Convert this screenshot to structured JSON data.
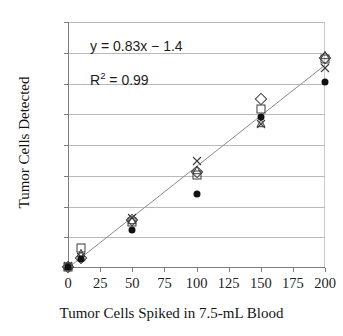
{
  "chart_data": {
    "type": "scatter",
    "title": "",
    "xlabel": "Tumor Cells Spiked in 7.5-mL Blood",
    "ylabel": "Tumor Cells Detected",
    "xlim": [
      0,
      200
    ],
    "ylim": [
      0,
      200
    ],
    "xticks": [
      0,
      25,
      50,
      75,
      100,
      125,
      150,
      175,
      200
    ],
    "yticks": [
      0,
      25,
      50,
      75,
      100,
      125,
      150,
      175,
      200
    ],
    "xtick_labels": [
      "0",
      "25",
      "50",
      "75",
      "100",
      "125",
      "150",
      "175",
      "200"
    ],
    "ytick_labels": [
      "0",
      "25",
      "50",
      "75",
      "100",
      "125",
      "150",
      "175",
      "200"
    ],
    "grid": "horizontal",
    "legend": "none",
    "annotations": [
      {
        "id": "equation",
        "text": "y = 0.83x − 1.4"
      },
      {
        "id": "r_squared",
        "text": "R2 = 0.99",
        "display": "R² = 0.99"
      }
    ],
    "trendline": {
      "type": "linear",
      "slope": 0.83,
      "intercept": -1.4,
      "r_squared": 0.99,
      "x_start": 0,
      "y_start": 0,
      "x_end": 200,
      "y_end": 165
    },
    "series": [
      {
        "name": "Replicate 1",
        "marker": "open-diamond",
        "points": [
          {
            "x": 0,
            "y": 1
          },
          {
            "x": 10,
            "y": 8
          },
          {
            "x": 50,
            "y": 39
          },
          {
            "x": 100,
            "y": 78
          },
          {
            "x": 150,
            "y": 137
          },
          {
            "x": 200,
            "y": 171
          }
        ]
      },
      {
        "name": "Replicate 2",
        "marker": "open-square",
        "points": [
          {
            "x": 0,
            "y": 1
          },
          {
            "x": 10,
            "y": 16
          },
          {
            "x": 50,
            "y": 37
          },
          {
            "x": 100,
            "y": 76
          },
          {
            "x": 150,
            "y": 129
          },
          {
            "x": 200,
            "y": 170
          }
        ]
      },
      {
        "name": "Replicate 3",
        "marker": "open-triangle",
        "points": [
          {
            "x": 0,
            "y": 2
          },
          {
            "x": 10,
            "y": 12
          },
          {
            "x": 50,
            "y": 39
          },
          {
            "x": 100,
            "y": 80
          },
          {
            "x": 150,
            "y": 118
          },
          {
            "x": 200,
            "y": 173
          }
        ]
      },
      {
        "name": "Replicate 4",
        "marker": "cross",
        "points": [
          {
            "x": 0,
            "y": 2
          },
          {
            "x": 10,
            "y": 9
          },
          {
            "x": 50,
            "y": 41
          },
          {
            "x": 100,
            "y": 87
          },
          {
            "x": 150,
            "y": 117
          },
          {
            "x": 200,
            "y": 163
          }
        ]
      },
      {
        "name": "Replicate 5",
        "marker": "filled-circle",
        "points": [
          {
            "x": 0,
            "y": 1
          },
          {
            "x": 10,
            "y": 7
          },
          {
            "x": 50,
            "y": 31
          },
          {
            "x": 100,
            "y": 60
          },
          {
            "x": 150,
            "y": 123
          },
          {
            "x": 200,
            "y": 151
          }
        ]
      }
    ],
    "colors": {
      "marker_outline": "#3b3b3b",
      "marker_fill": "#111111",
      "gridline": "#b9b9b9",
      "axis": "#7d7d7d",
      "trendline": "#8a8a8a",
      "text": "#1a1a1a"
    }
  }
}
